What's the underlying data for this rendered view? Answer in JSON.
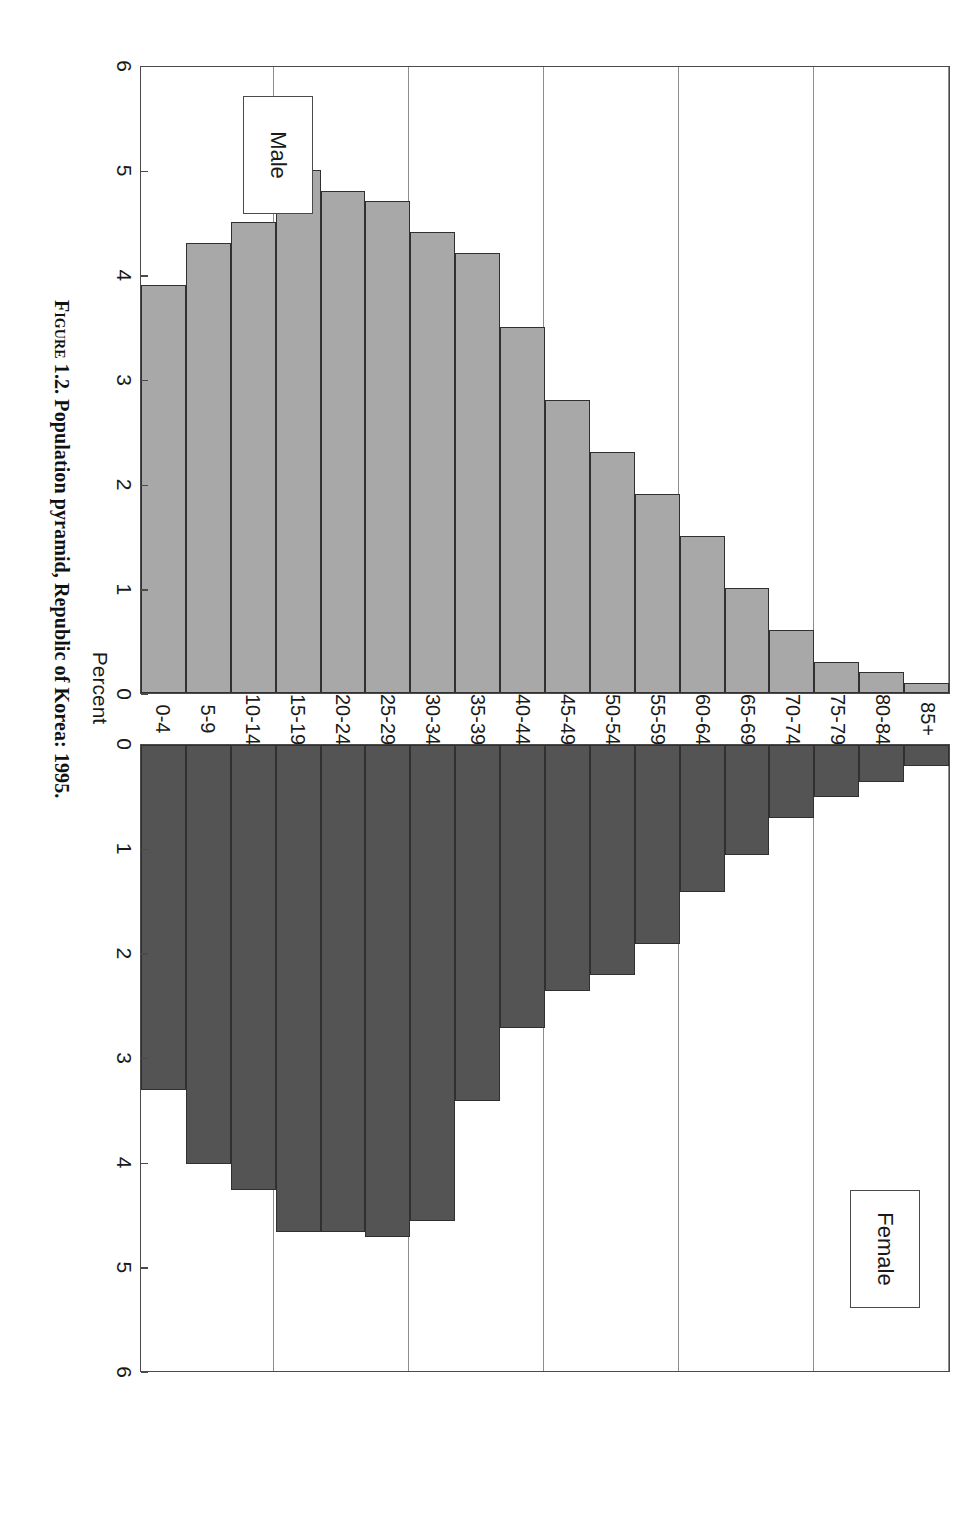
{
  "figure": {
    "caption_prefix": "Figure 1.2.",
    "caption_text": "Population pyramid, Republic of Korea: 1995."
  },
  "axis": {
    "percent_title": "Percent",
    "ticks": [
      "0",
      "1",
      "2",
      "3",
      "4",
      "5",
      "6"
    ]
  },
  "legend": {
    "male": "Male",
    "female": "Female"
  },
  "chart_data": {
    "type": "bar",
    "title": "Population pyramid, Republic of Korea: 1995.",
    "subtitle": "",
    "orientation": "horizontal-pyramid",
    "xlabel": "Percent",
    "ylabel": "",
    "xlim": [
      0,
      6
    ],
    "grid": true,
    "legend_position": "inside-panel",
    "categories": [
      "85+",
      "80-84",
      "75-79",
      "70-74",
      "65-69",
      "60-64",
      "55-59",
      "50-54",
      "45-49",
      "40-44",
      "35-39",
      "30-34",
      "25-29",
      "20-24",
      "15-19",
      "10-14",
      "5-9",
      "0-4"
    ],
    "series": [
      {
        "name": "Male",
        "color": "#a8a8a8",
        "values": [
          0.1,
          0.2,
          0.3,
          0.6,
          1.0,
          1.5,
          1.9,
          2.3,
          2.8,
          3.5,
          4.2,
          4.4,
          4.7,
          4.8,
          5.0,
          4.5,
          4.3,
          3.9
        ]
      },
      {
        "name": "Female",
        "color": "#545454",
        "values": [
          0.2,
          0.35,
          0.5,
          0.7,
          1.05,
          1.4,
          1.9,
          2.2,
          2.35,
          2.7,
          3.4,
          4.55,
          4.7,
          4.65,
          4.65,
          4.25,
          4.0,
          3.3
        ]
      }
    ],
    "note": "Values are percent of total population; Female bar for 0-4 is 3.6"
  }
}
